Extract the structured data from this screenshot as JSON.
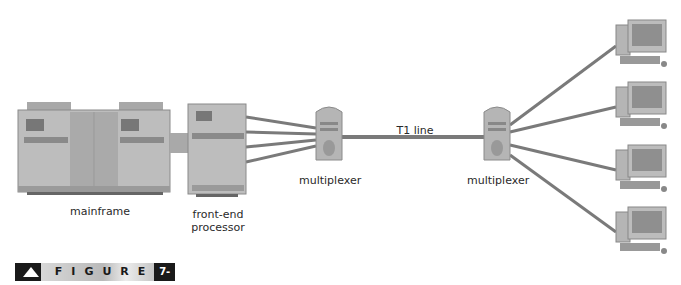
{
  "diagram": {
    "nodes": {
      "mainframe": {
        "label": "mainframe"
      },
      "front_end": {
        "label_line1": "front-end",
        "label_line2": "processor"
      },
      "mux_left": {
        "label": "multiplexer"
      },
      "mux_right": {
        "label": "multiplexer"
      },
      "terminals": [
        "PC 1",
        "PC 2",
        "PC 3",
        "PC 4"
      ]
    },
    "links": {
      "t1_label": "T1 line",
      "fep_to_mux_count": 4,
      "mux_to_pc_count": 4
    },
    "colors": {
      "line": "#7a7a7a",
      "device_body": "#b8b8b8",
      "device_dark": "#8a8a8a"
    }
  },
  "figure": {
    "word": "FIGURE",
    "number": "7-11"
  }
}
